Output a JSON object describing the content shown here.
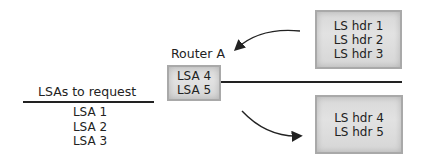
{
  "diagram": {
    "router": {
      "title": "Router A",
      "entries": [
        "LSA 4",
        "LSA 5"
      ]
    },
    "request_list": {
      "title": "LSAs to request",
      "entries": [
        "LSA 1",
        "LSA 2",
        "LSA 3"
      ]
    },
    "incoming_headers": {
      "entries": [
        "LS hdr 1",
        "LS hdr 2",
        "LS hdr 3"
      ]
    },
    "outgoing_headers": {
      "entries": [
        "LS hdr 4",
        "LS hdr 5"
      ]
    },
    "colors": {
      "box_fill": "#dcdcdc",
      "box_border": "#a9a9a9",
      "line": "#222222"
    }
  }
}
